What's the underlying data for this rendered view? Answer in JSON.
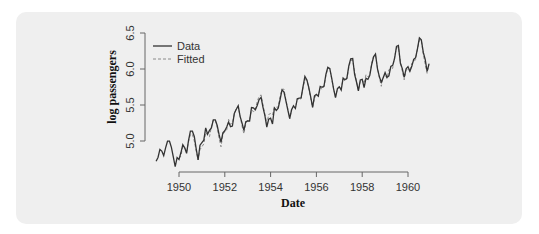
{
  "chart_data": {
    "type": "line",
    "title": "",
    "xlabel": "Date",
    "ylabel": "log passengers",
    "xlim": [
      1949,
      1961
    ],
    "ylim": [
      4.7,
      6.5
    ],
    "x_ticks": [
      "1950",
      "1952",
      "1954",
      "1956",
      "1958",
      "1960"
    ],
    "y_ticks": [
      "5.0",
      "5.5",
      "6.0",
      "6.5"
    ],
    "grid": false,
    "legend_position": "top-left",
    "legend": [
      "Data",
      "Fitted"
    ],
    "x_start": 1949.0,
    "x_step": 0.08333,
    "series": [
      {
        "name": "Data",
        "style": "solid",
        "color": "#333333",
        "values": [
          4.718,
          4.771,
          4.883,
          4.86,
          4.796,
          4.905,
          4.997,
          4.997,
          4.913,
          4.779,
          4.644,
          4.771,
          4.745,
          4.836,
          4.949,
          4.905,
          4.828,
          5.004,
          5.136,
          5.136,
          5.063,
          4.89,
          4.736,
          4.942,
          4.977,
          5.011,
          5.182,
          5.094,
          5.147,
          5.182,
          5.293,
          5.293,
          5.215,
          5.088,
          4.984,
          5.112,
          5.142,
          5.193,
          5.263,
          5.198,
          5.209,
          5.384,
          5.438,
          5.489,
          5.342,
          5.252,
          5.147,
          5.268,
          5.278,
          5.278,
          5.464,
          5.46,
          5.434,
          5.493,
          5.576,
          5.606,
          5.468,
          5.352,
          5.193,
          5.303,
          5.318,
          5.236,
          5.46,
          5.425,
          5.455,
          5.576,
          5.71,
          5.68,
          5.557,
          5.434,
          5.313,
          5.434,
          5.489,
          5.451,
          5.587,
          5.595,
          5.598,
          5.753,
          5.897,
          5.849,
          5.743,
          5.613,
          5.468,
          5.628,
          5.649,
          5.624,
          5.759,
          5.746,
          5.762,
          5.924,
          6.023,
          6.004,
          5.872,
          5.724,
          5.602,
          5.724,
          5.753,
          5.707,
          5.875,
          5.852,
          5.872,
          6.045,
          6.142,
          6.146,
          5.924,
          5.82,
          5.697,
          5.849,
          5.855,
          5.74,
          5.872,
          5.855,
          5.914,
          6.063,
          6.169,
          6.208,
          6.003,
          5.892,
          5.817,
          5.878,
          5.952,
          5.883,
          5.906,
          6.035,
          6.05,
          6.147,
          6.314,
          6.327,
          6.079,
          6.005,
          5.885,
          6.004,
          6.034,
          5.969,
          6.038,
          6.133,
          6.157,
          6.283,
          6.433,
          6.407,
          6.23,
          6.134,
          5.966,
          6.068
        ]
      },
      {
        "name": "Fitted",
        "style": "dashed",
        "color": "#888888",
        "values": [
          null,
          null,
          null,
          null,
          null,
          null,
          null,
          null,
          null,
          null,
          null,
          null,
          4.76,
          4.79,
          4.93,
          4.91,
          4.85,
          4.99,
          5.09,
          5.09,
          5.0,
          4.86,
          4.74,
          4.88,
          4.92,
          4.96,
          5.12,
          5.08,
          5.06,
          5.2,
          5.29,
          5.29,
          5.19,
          5.04,
          4.92,
          5.09,
          5.13,
          5.15,
          5.3,
          5.23,
          5.25,
          5.37,
          5.46,
          5.47,
          5.35,
          5.21,
          5.1,
          5.24,
          5.29,
          5.3,
          5.43,
          5.41,
          5.42,
          5.55,
          5.62,
          5.64,
          5.5,
          5.37,
          5.24,
          5.37,
          5.38,
          5.36,
          5.47,
          5.47,
          5.47,
          5.62,
          5.72,
          5.72,
          5.57,
          5.45,
          5.31,
          5.44,
          5.47,
          5.46,
          5.59,
          5.57,
          5.59,
          5.74,
          5.85,
          5.85,
          5.72,
          5.59,
          5.47,
          5.59,
          5.65,
          5.62,
          5.74,
          5.72,
          5.75,
          5.91,
          6.01,
          6.01,
          5.86,
          5.73,
          5.61,
          5.73,
          5.76,
          5.73,
          5.86,
          5.83,
          5.86,
          6.02,
          6.12,
          6.12,
          5.96,
          5.83,
          5.7,
          5.83,
          5.85,
          5.8,
          5.92,
          5.89,
          5.92,
          6.08,
          6.18,
          6.19,
          6.01,
          5.88,
          5.76,
          5.89,
          5.92,
          5.87,
          5.99,
          5.99,
          6.01,
          6.17,
          6.29,
          6.3,
          6.1,
          5.97,
          5.85,
          5.98,
          6.01,
          5.96,
          6.08,
          6.1,
          6.13,
          6.28,
          6.4,
          6.4,
          6.2,
          6.07,
          5.94,
          6.08
        ]
      }
    ]
  },
  "colors": {
    "card_background": "#efefef",
    "axis": "#666666"
  }
}
